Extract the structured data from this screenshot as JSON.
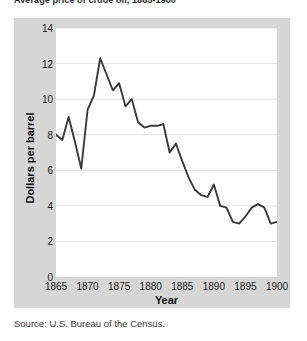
{
  "top_caption": {
    "visible_fragment": "Average price of crude oil, 1865-1900",
    "note_fragment": "(cut off at image edge)"
  },
  "source": {
    "text": "Source: U.S. Bureau of the Census."
  },
  "colors": {
    "panel_background": "#d6d6d6",
    "plot_background": "#ffffff",
    "line": "#3a3a3a",
    "gridline": "#e3e3e3",
    "text": "#1b1b1b"
  },
  "chart_data": {
    "type": "line",
    "title": "",
    "xlabel": "Year",
    "ylabel": "Dollars per barrel",
    "xlim": [
      1865,
      1900
    ],
    "ylim": [
      0,
      14
    ],
    "grid": "horizontal",
    "legend": "none",
    "y_ticks": [
      0,
      2,
      4,
      6,
      8,
      10,
      12,
      14
    ],
    "x_ticks": [
      1865,
      1870,
      1875,
      1880,
      1885,
      1890,
      1895,
      1900
    ],
    "x": [
      1865,
      1866,
      1867,
      1868,
      1869,
      1870,
      1871,
      1872,
      1873,
      1874,
      1875,
      1876,
      1877,
      1878,
      1879,
      1880,
      1881,
      1882,
      1883,
      1884,
      1885,
      1886,
      1887,
      1888,
      1889,
      1890,
      1891,
      1892,
      1893,
      1894,
      1895,
      1896,
      1897,
      1898,
      1899,
      1900
    ],
    "values": [
      8.0,
      7.7,
      9.0,
      7.6,
      6.1,
      9.4,
      10.2,
      12.3,
      11.4,
      10.5,
      10.9,
      9.6,
      10.0,
      8.7,
      8.4,
      8.5,
      8.5,
      8.6,
      7.0,
      7.5,
      6.5,
      5.6,
      4.9,
      4.6,
      4.5,
      5.2,
      4.0,
      3.9,
      3.1,
      3.0,
      3.4,
      3.9,
      4.1,
      3.9,
      3.0,
      3.1
    ],
    "annotations": []
  }
}
